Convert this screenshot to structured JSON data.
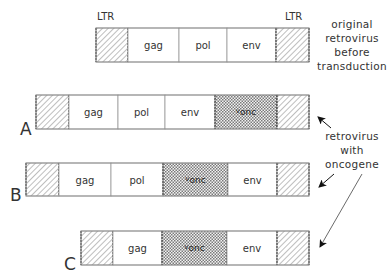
{
  "diagram": {
    "ltr_labels": [
      "LTR",
      "LTR"
    ],
    "original": {
      "caption": [
        "original",
        "retrovirus",
        "before",
        "transduction"
      ],
      "segments": [
        {
          "type": "ltr",
          "label": "",
          "x0": 96,
          "x1": 128
        },
        {
          "type": "gene",
          "label": "gag",
          "x0": 128,
          "x1": 179
        },
        {
          "type": "gene",
          "label": "pol",
          "x0": 179,
          "x1": 227
        },
        {
          "type": "gene",
          "label": "env",
          "x0": 227,
          "x1": 276
        },
        {
          "type": "ltr",
          "label": "",
          "x0": 276,
          "x1": 309
        }
      ]
    },
    "rows": [
      {
        "letter": "A",
        "segments": [
          {
            "type": "ltr",
            "label": "",
            "x0": 36,
            "x1": 69
          },
          {
            "type": "gene",
            "label": "gag",
            "x0": 69,
            "x1": 118
          },
          {
            "type": "gene",
            "label": "pol",
            "x0": 118,
            "x1": 165
          },
          {
            "type": "gene",
            "label": "env",
            "x0": 165,
            "x1": 215
          },
          {
            "type": "onc",
            "label": "v-onc",
            "x0": 215,
            "x1": 277
          },
          {
            "type": "ltr",
            "label": "",
            "x0": 277,
            "x1": 309
          }
        ]
      },
      {
        "letter": "B",
        "segments": [
          {
            "type": "ltr",
            "label": "",
            "x0": 26,
            "x1": 59
          },
          {
            "type": "gene",
            "label": "gag",
            "x0": 59,
            "x1": 111
          },
          {
            "type": "gene",
            "label": "pol",
            "x0": 111,
            "x1": 163
          },
          {
            "type": "onc",
            "label": "v-onc",
            "x0": 163,
            "x1": 228
          },
          {
            "type": "gene",
            "label": "env",
            "x0": 228,
            "x1": 277
          },
          {
            "type": "ltr",
            "label": "",
            "x0": 277,
            "x1": 309
          }
        ]
      },
      {
        "letter": "C",
        "segments": [
          {
            "type": "ltr",
            "label": "",
            "x0": 81,
            "x1": 113
          },
          {
            "type": "gene",
            "label": "gag",
            "x0": 113,
            "x1": 162
          },
          {
            "type": "onc",
            "label": "v-onc",
            "x0": 162,
            "x1": 227
          },
          {
            "type": "gene",
            "label": "env",
            "x0": 227,
            "x1": 277
          },
          {
            "type": "ltr",
            "label": "",
            "x0": 277,
            "x1": 309
          }
        ]
      }
    ],
    "side_caption": [
      "retrovirus",
      "with",
      "oncogene"
    ],
    "vonc": {
      "prefix": "v",
      "suffix": "onc"
    }
  }
}
